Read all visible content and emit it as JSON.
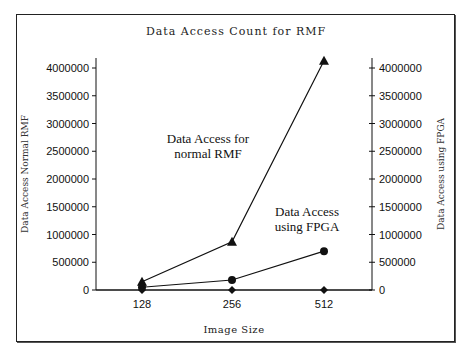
{
  "chart_data": {
    "type": "line",
    "title": "Data Access Count for RMF",
    "xlabel": "Image Size",
    "ylabel_left": "Data Access Normal RMF",
    "ylabel_right": "Data Access using FPGA",
    "categories": [
      "128",
      "256",
      "512"
    ],
    "ylim": [
      0,
      4000000
    ],
    "y_ticks": [
      "4000000",
      "3500000",
      "3000000",
      "2500000",
      "2000000",
      "1500000",
      "1000000",
      "500000",
      "0"
    ],
    "grid": false,
    "legend": "none (inline annotations)",
    "series": [
      {
        "name": "Data Access for normal RMF",
        "marker": "triangle",
        "axis": "left",
        "values": [
          150000,
          870000,
          4130000
        ]
      },
      {
        "name": "Data Access using FPGA",
        "marker": "circle",
        "axis": "right",
        "values": [
          50000,
          180000,
          700000
        ]
      },
      {
        "name": "Baseline",
        "marker": "diamond",
        "axis": "left",
        "values": [
          0,
          0,
          0
        ]
      }
    ],
    "annotations": [
      {
        "lines": [
          "Data Access for",
          "normal RMF"
        ]
      },
      {
        "lines": [
          "Data Access",
          "using FPGA"
        ]
      }
    ]
  }
}
